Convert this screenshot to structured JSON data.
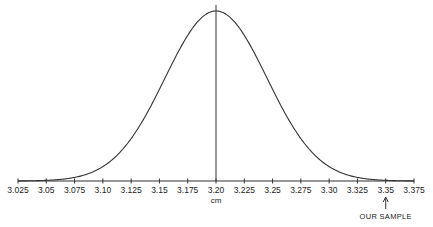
{
  "chart_data": {
    "type": "line",
    "title": "",
    "xlabel": "cm",
    "ylabel": "",
    "x_ticks": [
      "3.025",
      "3.05",
      "3.075",
      "3.10",
      "3.125",
      "3.15",
      "3.175",
      "3.20",
      "3.225",
      "3.25",
      "3.275",
      "3.30",
      "3.325",
      "3.35",
      "3.375"
    ],
    "xlim": [
      3.025,
      3.375
    ],
    "grid": false,
    "legend": null,
    "series": [
      {
        "name": "normal distribution",
        "distribution": "normal",
        "mean": 3.2,
        "std_dev": 0.045,
        "x": [
          3.025,
          3.05,
          3.075,
          3.1,
          3.125,
          3.15,
          3.175,
          3.2,
          3.225,
          3.25,
          3.275,
          3.3,
          3.325,
          3.35,
          3.375
        ],
        "values": [
          0.02,
          0.07,
          0.21,
          0.08,
          0.25,
          0.54,
          0.86,
          1.0,
          0.86,
          0.54,
          0.25,
          0.08,
          0.02,
          0.004,
          0.0005
        ]
      }
    ],
    "mean_line": {
      "x": 3.2
    },
    "annotations": [
      {
        "text": "OUR SAMPLE",
        "x": 3.35,
        "type": "arrow-up"
      }
    ]
  },
  "axis": {
    "unit_label": "cm"
  },
  "annotation": {
    "label": "OUR SAMPLE"
  }
}
